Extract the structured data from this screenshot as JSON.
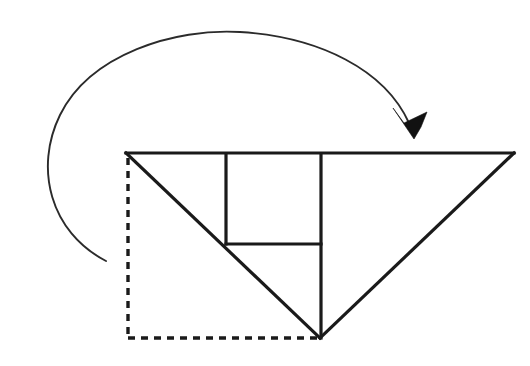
{
  "figure": {
    "background_color": "#ffffff",
    "line_color": "#1a1a1a",
    "thin_line_color": "#2b2b2b",
    "arrow_color": "#111111",
    "canvas": {
      "width": 530,
      "height": 366
    }
  },
  "shapes": {
    "ghost_square": {
      "name": "original-square-outline",
      "style": "dashed",
      "left": 128,
      "top": 158,
      "right": 320,
      "bottom": 338,
      "vertical_path": "M 128 158 L 128 338",
      "horizontal_path": "M 128 338 L 322 338"
    },
    "main_triangle": {
      "name": "inverted-triangle",
      "style": "solid",
      "vertices": [
        {
          "label": "top-left",
          "x": 126,
          "y": 153
        },
        {
          "label": "top-right",
          "x": 514,
          "y": 153
        },
        {
          "label": "bottom-apex",
          "x": 320,
          "y": 338
        }
      ],
      "top_edge_path": "M 126 153 L 514 153",
      "right_edge_path": "M 514 153 L 320 338",
      "left_diagonal_path": "M 126 153 L 320 338"
    },
    "inner_square": {
      "name": "inner-square-crease",
      "style": "solid",
      "left": 226,
      "top": 155,
      "right": 321,
      "bottom": 244,
      "left_edge_path": "M 226 155 L 226 244",
      "bottom_edge_path": "M 226 244 L 321 244"
    },
    "center_crease": {
      "name": "center-vertical-crease",
      "style": "solid",
      "path": "M 321 155 L 321 338"
    }
  },
  "arrow": {
    "name": "fold-direction-arrow",
    "style": "thin-curved",
    "description": "counterclockwise arc sweeping from lower-left up over the top and down to the right",
    "arc_path": "M 106 261 C 50 232 34 168 60 115 C 90 54 175 28 240 32 C 320 37 385 70 409 123",
    "tail": {
      "x": 106,
      "y": 261
    },
    "apex": {
      "x": 232,
      "y": 32
    },
    "leftmost": {
      "x": 38,
      "y": 150
    },
    "head_tip": {
      "x": 414,
      "y": 139
    },
    "head_polygon": "414,139 393,108 404,123 427,112 421,127"
  },
  "labels": []
}
